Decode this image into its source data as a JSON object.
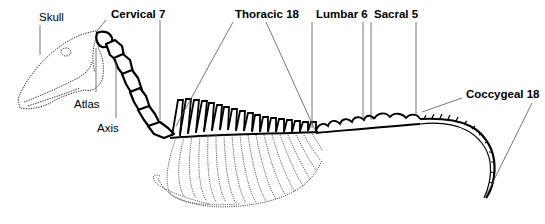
{
  "diagram": {
    "labels": [
      {
        "id": "skull",
        "text": "Skull",
        "x": 39,
        "y": 14,
        "weight": "normal"
      },
      {
        "id": "cervical",
        "text": "Cervical 7",
        "x": 111,
        "y": 12,
        "weight": "bold"
      },
      {
        "id": "thoracic",
        "text": "Thoracic 18",
        "x": 235,
        "y": 12,
        "weight": "bold"
      },
      {
        "id": "lumbar",
        "text": "Lumbar 6",
        "x": 316,
        "y": 12,
        "weight": "bold"
      },
      {
        "id": "sacral",
        "text": "Sacral 5",
        "x": 374,
        "y": 12,
        "weight": "bold"
      },
      {
        "id": "coccygeal",
        "text": "Coccygeal 18",
        "x": 466,
        "y": 92,
        "weight": "bold"
      },
      {
        "id": "atlas",
        "text": "Atlas",
        "x": 74,
        "y": 101,
        "weight": "normal"
      },
      {
        "id": "axis",
        "text": "Axis",
        "x": 97,
        "y": 125,
        "weight": "normal"
      }
    ],
    "colors": {
      "line": "#000000",
      "leader": "#555555",
      "background": "#ffffff"
    }
  }
}
